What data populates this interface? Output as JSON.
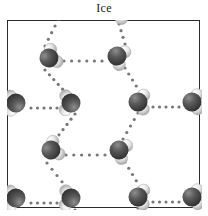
{
  "figure": {
    "title": "Ice",
    "caption_position": "top-center",
    "frame": {
      "x": 7,
      "y": 20,
      "width": 193,
      "height": 188,
      "border_color": "#2b2b2b",
      "border_width": 1,
      "background": "#ffffff"
    },
    "canvas": {
      "width": 208,
      "height": 216,
      "background": "#ffffff"
    }
  },
  "legend": {
    "oxygen_label": "oxygen",
    "hydrogen_label": "hydrogen",
    "bond_label": "hydrogen bond"
  },
  "colors": {
    "oxygen_dark": "#3c3c3c",
    "oxygen_mid": "#5a5a5a",
    "oxygen_highlight": "#8e8e8e",
    "hydrogen_light": "#f2f2f2",
    "hydrogen_mid": "#d8d8d8",
    "hydrogen_shadow": "#a8a8a8",
    "bond_dot": "#777777",
    "frame_border": "#2b2b2b",
    "title_text": "#1a1a1a"
  },
  "structure": {
    "type": "hexagonal-ice-lattice",
    "molecule_name": "water",
    "molecule_count": 16,
    "bond_dot_radius": 1.6,
    "oxygen_radius": 9.5,
    "hydrogen_radius": 6.2,
    "molecules": [
      {
        "id": "m1",
        "cx": 42,
        "cy": 38,
        "rot": -28,
        "name": "water-molecule-top-left-inner"
      },
      {
        "id": "m2",
        "cx": 110,
        "cy": 36,
        "rot": 24,
        "name": "water-molecule-top-right-inner"
      },
      {
        "id": "m3",
        "cx": 9,
        "cy": 83,
        "rot": 178,
        "name": "water-molecule-left-edge-upper"
      },
      {
        "id": "m4",
        "cx": 64,
        "cy": 83,
        "rot": 182,
        "name": "water-molecule-left-upper-inner"
      },
      {
        "id": "m5",
        "cx": 131,
        "cy": 82,
        "rot": 2,
        "name": "water-molecule-right-upper-inner"
      },
      {
        "id": "m6",
        "cx": 185,
        "cy": 82,
        "rot": 358,
        "name": "water-molecule-right-edge-upper"
      },
      {
        "id": "m7",
        "cx": 44,
        "cy": 130,
        "rot": -26,
        "name": "water-molecule-center-left"
      },
      {
        "id": "m8",
        "cx": 112,
        "cy": 130,
        "rot": 22,
        "name": "water-molecule-center-right"
      },
      {
        "id": "m9",
        "cx": 9,
        "cy": 178,
        "rot": 178,
        "name": "water-molecule-left-edge-lower"
      },
      {
        "id": "m10",
        "cx": 64,
        "cy": 178,
        "rot": 182,
        "name": "water-molecule-left-lower-inner"
      },
      {
        "id": "m11",
        "cx": 131,
        "cy": 177,
        "rot": 2,
        "name": "water-molecule-right-lower-inner"
      },
      {
        "id": "m12",
        "cx": 185,
        "cy": 177,
        "rot": 358,
        "name": "water-molecule-right-edge-lower"
      },
      {
        "id": "m13",
        "cx": 44,
        "cy": 225,
        "rot": -26,
        "name": "water-molecule-bottom-left-inner"
      },
      {
        "id": "m14",
        "cx": 112,
        "cy": 224,
        "rot": 22,
        "name": "water-molecule-bottom-right-inner"
      },
      {
        "id": "m15",
        "cx": 44,
        "cy": -10,
        "rot": -26,
        "name": "water-molecule-offscreen-top-left"
      },
      {
        "id": "m16",
        "cx": 112,
        "cy": -10,
        "rot": 22,
        "name": "water-molecule-offscreen-top-right"
      }
    ],
    "bonds": [
      {
        "id": "b1",
        "x1": 57,
        "y1": 41,
        "x2": 95,
        "y2": 41,
        "name": "hbond-top-horizontal"
      },
      {
        "id": "b2",
        "x1": 24,
        "y1": 88,
        "x2": 50,
        "y2": 88,
        "name": "hbond-left-upper-horizontal"
      },
      {
        "id": "b3",
        "x1": 146,
        "y1": 87,
        "x2": 172,
        "y2": 87,
        "name": "hbond-right-upper-horizontal"
      },
      {
        "id": "b4",
        "x1": 59,
        "y1": 135,
        "x2": 98,
        "y2": 135,
        "name": "hbond-center-horizontal"
      },
      {
        "id": "b5",
        "x1": 24,
        "y1": 183,
        "x2": 50,
        "y2": 183,
        "name": "hbond-left-lower-horizontal"
      },
      {
        "id": "b6",
        "x1": 146,
        "y1": 182,
        "x2": 172,
        "y2": 182,
        "name": "hbond-right-lower-horizontal"
      },
      {
        "id": "b7",
        "x1": 59,
        "y1": 230,
        "x2": 98,
        "y2": 230,
        "name": "hbond-bottom-horizontal"
      },
      {
        "id": "b8",
        "x1": 38,
        "y1": 50,
        "x2": 60,
        "y2": 74,
        "name": "hbond-diag-upper-left-a"
      },
      {
        "id": "b9",
        "x1": 68,
        "y1": 94,
        "x2": 48,
        "y2": 120,
        "name": "hbond-diag-upper-left-b"
      },
      {
        "id": "b10",
        "x1": 118,
        "y1": 48,
        "x2": 133,
        "y2": 72,
        "name": "hbond-diag-upper-right-a"
      },
      {
        "id": "b11",
        "x1": 131,
        "y1": 93,
        "x2": 116,
        "y2": 119,
        "name": "hbond-diag-upper-right-b"
      },
      {
        "id": "b12",
        "x1": 40,
        "y1": 143,
        "x2": 60,
        "y2": 168,
        "name": "hbond-diag-lower-left-a"
      },
      {
        "id": "b13",
        "x1": 68,
        "y1": 190,
        "x2": 48,
        "y2": 215,
        "name": "hbond-diag-lower-left-b"
      },
      {
        "id": "b14",
        "x1": 118,
        "y1": 142,
        "x2": 133,
        "y2": 167,
        "name": "hbond-diag-lower-right-a"
      },
      {
        "id": "b15",
        "x1": 131,
        "y1": 188,
        "x2": 116,
        "y2": 214,
        "name": "hbond-diag-lower-right-b"
      },
      {
        "id": "b16",
        "x1": 38,
        "y1": 26,
        "x2": 48,
        "y2": 6,
        "name": "hbond-diag-top-left-edge"
      },
      {
        "id": "b17",
        "x1": 118,
        "y1": 24,
        "x2": 112,
        "y2": 4,
        "name": "hbond-diag-top-right-edge"
      },
      {
        "id": "b18",
        "x1": 40,
        "y1": 238,
        "x2": 48,
        "y2": 252,
        "name": "hbond-diag-bottom-left-edge"
      },
      {
        "id": "b19",
        "x1": 118,
        "y1": 237,
        "x2": 112,
        "y2": 252,
        "name": "hbond-diag-bottom-right-edge"
      }
    ]
  }
}
